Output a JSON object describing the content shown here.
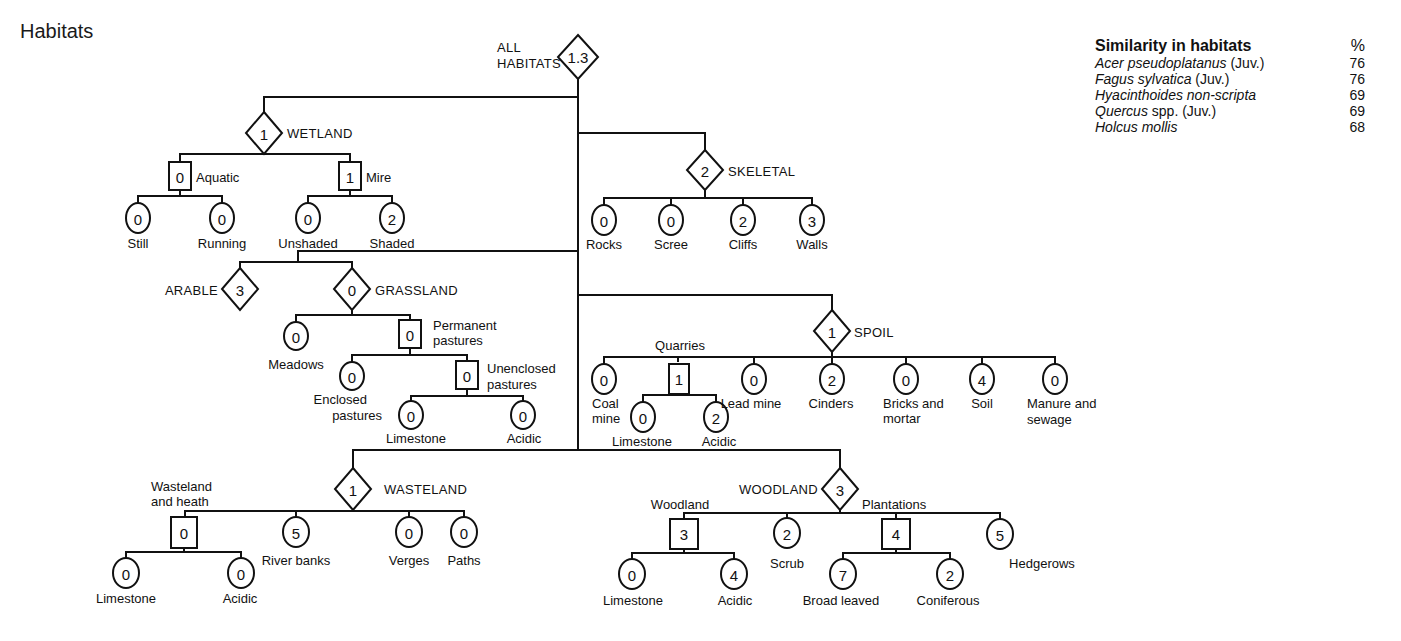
{
  "title": "Habitats",
  "legend": {
    "heading": "Similarity in habitats",
    "unit": "%",
    "rows": [
      {
        "italic": "Acer pseudoplatanus",
        "plain": " (Juv.)",
        "value": "76"
      },
      {
        "italic": "Fagus sylvatica",
        "plain": " (Juv.)",
        "value": "76"
      },
      {
        "italic": "Hyacinthoides non-scripta",
        "plain": "",
        "value": "69"
      },
      {
        "italic": "Quercus",
        "plain": " spp. (Juv.)",
        "value": "69"
      },
      {
        "italic": "Holcus mollis",
        "plain": "",
        "value": "68"
      }
    ]
  },
  "tree": {
    "root": {
      "label": "ALL HABITATS",
      "value": "1.3",
      "shape": "diamond"
    },
    "wetland": {
      "label": "WETLAND",
      "value": "1",
      "shape": "diamond",
      "aquatic": {
        "label": "Aquatic",
        "value": "0",
        "shape": "square",
        "children": [
          {
            "label": "Still",
            "value": "0"
          },
          {
            "label": "Running",
            "value": "0"
          }
        ]
      },
      "mire": {
        "label": "Mire",
        "value": "1",
        "shape": "square",
        "children": [
          {
            "label": "Unshaded",
            "value": "0"
          },
          {
            "label": "Shaded",
            "value": "2"
          }
        ]
      }
    },
    "skeletal": {
      "label": "SKELETAL",
      "value": "2",
      "shape": "diamond",
      "children": [
        {
          "label": "Rocks",
          "value": "0"
        },
        {
          "label": "Scree",
          "value": "0"
        },
        {
          "label": "Cliffs",
          "value": "2"
        },
        {
          "label": "Walls",
          "value": "3"
        }
      ]
    },
    "arable": {
      "label": "ARABLE",
      "value": "3",
      "shape": "diamond"
    },
    "grassland": {
      "label": "GRASSLAND",
      "value": "0",
      "shape": "diamond",
      "meadows": {
        "label": "Meadows",
        "value": "0"
      },
      "permanent": {
        "label1": "Permanent",
        "label2": "pastures",
        "value": "0",
        "shape": "square",
        "enclosed": {
          "label1": "Enclosed",
          "label2": "pastures",
          "value": "0"
        },
        "unenclosed": {
          "label1": "Unenclosed",
          "label2": "pastures",
          "value": "0",
          "shape": "square",
          "children": [
            {
              "label": "Limestone",
              "value": "0"
            },
            {
              "label": "Acidic",
              "value": "0"
            }
          ]
        }
      }
    },
    "spoil": {
      "label": "SPOIL",
      "value": "1",
      "shape": "diamond",
      "coal": {
        "label1": "Coal",
        "label2": "mine",
        "value": "0"
      },
      "quarries": {
        "label": "Quarries",
        "value": "1",
        "shape": "square",
        "children": [
          {
            "label": "Limestone",
            "value": "0"
          },
          {
            "label": "Acidic",
            "value": "2"
          }
        ]
      },
      "lead": {
        "label": "Lead mine",
        "value": "0"
      },
      "cinders": {
        "label": "Cinders",
        "value": "2"
      },
      "bricks": {
        "label1": "Bricks and",
        "label2": "mortar",
        "value": "0"
      },
      "soil": {
        "label": "Soil",
        "value": "4"
      },
      "manure": {
        "label1": "Manure and",
        "label2": "sewage",
        "value": "0"
      }
    },
    "wasteland": {
      "label": "WASTELAND",
      "value": "1",
      "shape": "diamond",
      "heath": {
        "label1": "Wasteland",
        "label2": "and heath",
        "value": "0",
        "shape": "square",
        "children": [
          {
            "label": "Limestone",
            "value": "0"
          },
          {
            "label": "Acidic",
            "value": "0"
          }
        ]
      },
      "river": {
        "label": "River banks",
        "value": "5"
      },
      "verges": {
        "label": "Verges",
        "value": "0"
      },
      "paths": {
        "label": "Paths",
        "value": "0"
      }
    },
    "woodland": {
      "label": "WOODLAND",
      "value": "3",
      "shape": "diamond",
      "wood": {
        "label": "Woodland",
        "value": "3",
        "shape": "square",
        "children": [
          {
            "label": "Limestone",
            "value": "0"
          },
          {
            "label": "Acidic",
            "value": "4"
          }
        ]
      },
      "scrub": {
        "label": "Scrub",
        "value": "2"
      },
      "plantations": {
        "label": "Plantations",
        "value": "4",
        "shape": "square",
        "children": [
          {
            "label": "Broad leaved",
            "value": "7"
          },
          {
            "label": "Coniferous",
            "value": "2"
          }
        ]
      },
      "hedgerows": {
        "label": "Hedgerows",
        "value": "5"
      }
    }
  }
}
